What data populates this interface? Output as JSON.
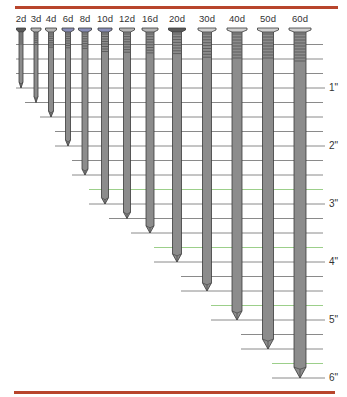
{
  "colors": {
    "rule": "#b8452c",
    "nail_fill": "#8c8c8c",
    "nail_head_dark": "#5a5a5a",
    "nail_head_blue": "#8a8fb8",
    "nail_outline": "#3a3a3a",
    "grid_line": "#8a8a8a",
    "grid_accent": "#9ccf8a"
  },
  "scale": {
    "px_per_inch": 58,
    "zero_y": 30,
    "tick_interval_in": 0.25
  },
  "ruler": {
    "labels": [
      {
        "text": "1\"",
        "inches": 1
      },
      {
        "text": "2\"",
        "inches": 2
      },
      {
        "text": "3\"",
        "inches": 3
      },
      {
        "text": "4\"",
        "inches": 4
      },
      {
        "text": "5\"",
        "inches": 5
      },
      {
        "text": "6\"",
        "inches": 6
      }
    ]
  },
  "nails": [
    {
      "label": "2d",
      "x": 21,
      "length_in": 1.0,
      "shank_w": 4,
      "head_w": 9,
      "head": "dark"
    },
    {
      "label": "3d",
      "x": 36,
      "length_in": 1.25,
      "shank_w": 4,
      "head_w": 10,
      "head": "normal"
    },
    {
      "label": "4d",
      "x": 51,
      "length_in": 1.5,
      "shank_w": 5,
      "head_w": 11,
      "head": "normal"
    },
    {
      "label": "6d",
      "x": 68,
      "length_in": 2.0,
      "shank_w": 5,
      "head_w": 12,
      "head": "blue"
    },
    {
      "label": "8d",
      "x": 85,
      "length_in": 2.5,
      "shank_w": 6,
      "head_w": 13,
      "head": "blue"
    },
    {
      "label": "10d",
      "x": 105,
      "length_in": 3.0,
      "shank_w": 7,
      "head_w": 14,
      "head": "blue"
    },
    {
      "label": "12d",
      "x": 127,
      "length_in": 3.25,
      "shank_w": 7,
      "head_w": 15,
      "head": "normal"
    },
    {
      "label": "16d",
      "x": 150,
      "length_in": 3.5,
      "shank_w": 8,
      "head_w": 16,
      "head": "normal"
    },
    {
      "label": "20d",
      "x": 177,
      "length_in": 4.0,
      "shank_w": 9,
      "head_w": 17,
      "head": "dark"
    },
    {
      "label": "30d",
      "x": 207,
      "length_in": 4.5,
      "shank_w": 9,
      "head_w": 18,
      "head": "light"
    },
    {
      "label": "40d",
      "x": 237,
      "length_in": 5.0,
      "shank_w": 10,
      "head_w": 20,
      "head": "light"
    },
    {
      "label": "50d",
      "x": 268,
      "length_in": 5.5,
      "shank_w": 11,
      "head_w": 21,
      "head": "light"
    },
    {
      "label": "60d",
      "x": 300,
      "length_in": 6.0,
      "shank_w": 12,
      "head_w": 22,
      "head": "light"
    }
  ]
}
